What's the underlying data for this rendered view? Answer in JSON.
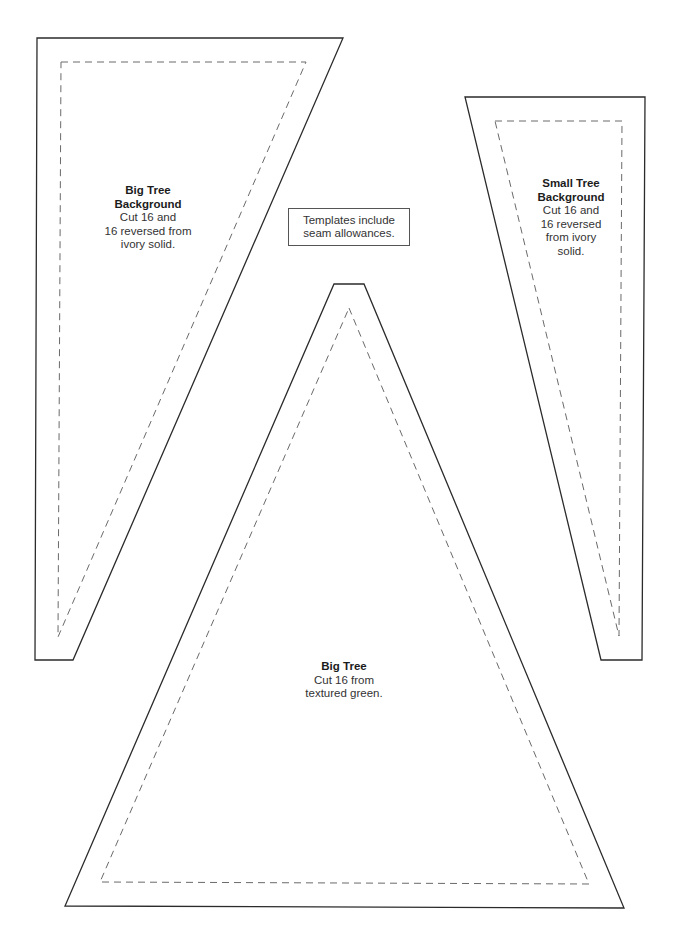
{
  "note": {
    "line1": "Templates include",
    "line2": "seam allowances."
  },
  "templates": [
    {
      "id": "big-tree-background",
      "title_line1": "Big Tree",
      "title_line2": "Background",
      "body_line1": "Cut 16 and",
      "body_line2": "16 reversed from",
      "body_line3": "ivory solid."
    },
    {
      "id": "small-tree-background",
      "title_line1": "Small Tree",
      "title_line2": "Background",
      "body_line1": "Cut 16 and",
      "body_line2": "16 reversed",
      "body_line3": "from ivory",
      "body_line4": "solid."
    },
    {
      "id": "big-tree",
      "title_line1": "Big Tree",
      "body_line1": "Cut 16 from",
      "body_line2": "textured green."
    }
  ],
  "colors": {
    "cut_line": "#2b2b2b",
    "seam_line": "#6a6a6a",
    "background": "#ffffff"
  }
}
